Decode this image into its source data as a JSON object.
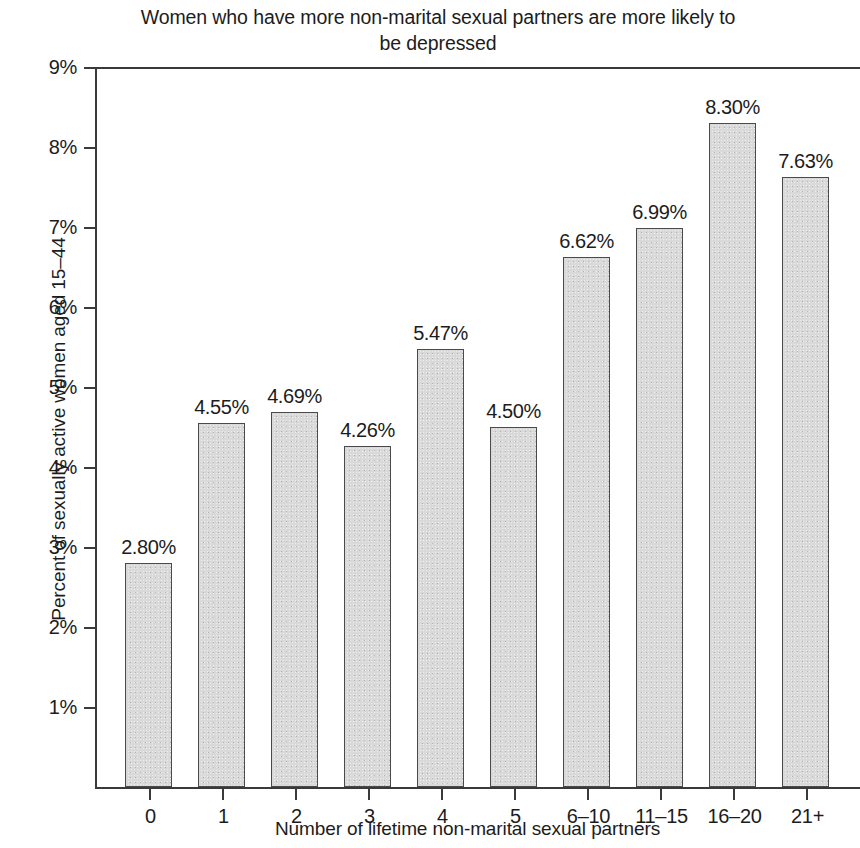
{
  "chart_data": {
    "type": "bar",
    "title": "Women who have more non-marital sexual partners are more likely to be depressed",
    "title_line1": "Women who have more non-marital sexual partners are more likely to",
    "title_line2": "be depressed",
    "xlabel": "Number of lifetime non-marital sexual partners",
    "ylabel": "Percent of sexually active women aged 15–44",
    "categories": [
      "0",
      "1",
      "2",
      "3",
      "4",
      "5",
      "6–10",
      "11–15",
      "16–20",
      "21+"
    ],
    "values": [
      2.8,
      4.55,
      4.69,
      4.26,
      5.47,
      4.5,
      6.62,
      6.99,
      8.3,
      7.63
    ],
    "value_labels": [
      "2.80%",
      "4.55%",
      "4.69%",
      "4.26%",
      "5.47%",
      "4.50%",
      "6.62%",
      "6.99%",
      "8.30%",
      "7.63%"
    ],
    "ylim": [
      0,
      9
    ],
    "ytick_values": [
      1,
      2,
      3,
      4,
      5,
      6,
      7,
      8,
      9
    ],
    "ytick_labels": [
      "1%",
      "2%",
      "3%",
      "4%",
      "5%",
      "6%",
      "7%",
      "8%",
      "9%"
    ],
    "grid": false,
    "legend": "none",
    "bar_color": "#d9d9d9",
    "bar_border_color": "#4a4a4a",
    "axis_color": "#3a3a3a",
    "background_color": "#ffffff"
  }
}
